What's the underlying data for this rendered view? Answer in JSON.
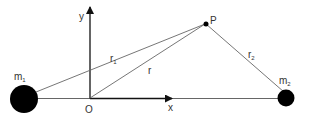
{
  "diagram": {
    "labels": {
      "m1": "m",
      "m1_sub": "1",
      "m2": "m",
      "m2_sub": "2",
      "y_axis": "y",
      "x_axis": "x",
      "origin": "O",
      "point": "P",
      "r": "r",
      "r1": "r",
      "r1_sub": "1",
      "r2": "r",
      "r2_sub": "2"
    },
    "colors": {
      "line": "#555555",
      "axis": "#111111",
      "mass": "#000000"
    }
  }
}
